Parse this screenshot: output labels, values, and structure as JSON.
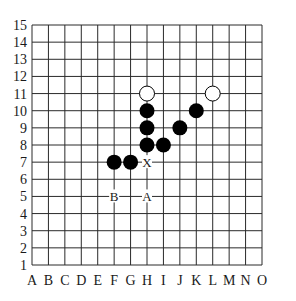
{
  "board": {
    "size": 15,
    "columns": [
      "A",
      "B",
      "C",
      "D",
      "E",
      "F",
      "G",
      "H",
      "I",
      "J",
      "K",
      "L",
      "M",
      "N",
      "O"
    ],
    "rows": [
      "1",
      "2",
      "3",
      "4",
      "5",
      "6",
      "7",
      "8",
      "9",
      "10",
      "11",
      "12",
      "13",
      "14",
      "15"
    ],
    "colors": {
      "line": "#2a2a2a",
      "black_stone": "#000000",
      "white_stone": "#ffffff",
      "background": "#ffffff"
    }
  },
  "stones": [
    {
      "color": "white",
      "col": "H",
      "row": 11
    },
    {
      "color": "white",
      "col": "L",
      "row": 11
    },
    {
      "color": "black",
      "col": "H",
      "row": 10
    },
    {
      "color": "black",
      "col": "K",
      "row": 10
    },
    {
      "color": "black",
      "col": "H",
      "row": 9
    },
    {
      "color": "black",
      "col": "J",
      "row": 9
    },
    {
      "color": "black",
      "col": "H",
      "row": 8
    },
    {
      "color": "black",
      "col": "I",
      "row": 8
    },
    {
      "color": "black",
      "col": "F",
      "row": 7
    },
    {
      "color": "black",
      "col": "G",
      "row": 7
    }
  ],
  "markers": [
    {
      "label": "X",
      "col": "H",
      "row": 7
    },
    {
      "label": "B",
      "col": "F",
      "row": 5
    },
    {
      "label": "A",
      "col": "H",
      "row": 5
    }
  ]
}
